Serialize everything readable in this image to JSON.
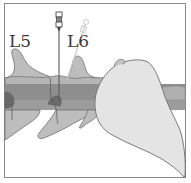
{
  "figure": {
    "type": "medical-illustration",
    "labels": [
      {
        "id": "l5",
        "text": "L5"
      },
      {
        "id": "l6",
        "text": "L6"
      }
    ],
    "colors": {
      "frame": "#8a8a8a",
      "bone": "#bdbdbd",
      "bone_dark": "#a6a6a6",
      "canal_band": "#8e8e8e",
      "canal_band_light": "#9c9c9c",
      "soft_tissue": "#7a7a7a",
      "hand": "#e4e4e4",
      "outline": "#6e6e6e",
      "needle": "#5a5a5a",
      "needle_ghost": "#c8c8c8"
    }
  }
}
